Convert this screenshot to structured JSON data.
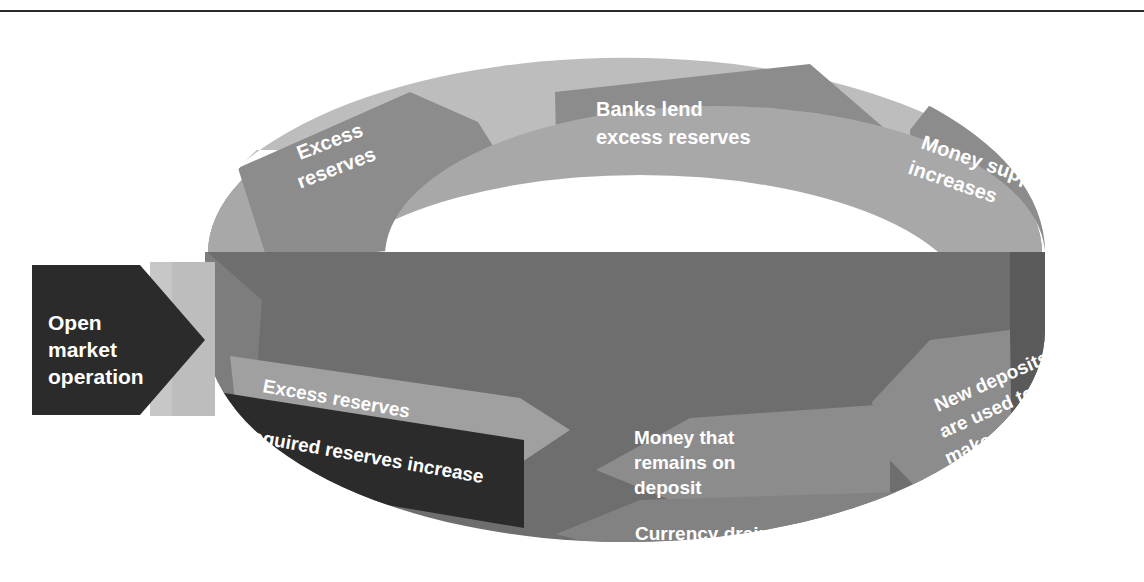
{
  "diagram": {
    "type": "circular-flow-ring",
    "entry_box": {
      "label_line1": "Open",
      "label_line2": "market",
      "label_line3": "operation",
      "shape": "arrow-right-block",
      "color": "#2b2b2b",
      "text_color": "#ffffff"
    },
    "upper_band": {
      "description": "Front-upper half of ring, flow left to right",
      "steps": [
        {
          "id": "excess-reserves-top",
          "label_lines": [
            "Excess",
            "reserves"
          ],
          "arrow_color": "#8c8c8c",
          "band_color": "#bdbdbd",
          "rotation": -22
        },
        {
          "id": "banks-lend",
          "label_lines": [
            "Banks lend",
            "excess reserves"
          ],
          "arrow_color": "#8c8c8c",
          "band_color": "#bdbdbd",
          "rotation": 0
        },
        {
          "id": "money-supply-increases",
          "label_lines": [
            "Money supply",
            "increases"
          ],
          "arrow_color": "#8c8c8c",
          "band_color": "#bdbdbd",
          "rotation": 20
        }
      ]
    },
    "lower_band": {
      "description": "Front-lower half of ring, flow right to left",
      "steps": [
        {
          "id": "new-deposits",
          "label_lines": [
            "New deposits",
            "are used to",
            "make payments"
          ],
          "arrow_color": "#8c8c8c",
          "band_color": "#6e6e6e",
          "rotation": -24
        },
        {
          "id": "money-remains-on-deposit",
          "label_lines": [
            "Money that",
            "remains on",
            "deposit"
          ],
          "arrow_color": "#8c8c8c",
          "band_color": "#6e6e6e",
          "rotation": 0
        },
        {
          "id": "currency-drain",
          "label_lines": [
            "Currency drain"
          ],
          "arrow_color": "#787878",
          "band_color": "#6e6e6e",
          "rotation": 0
        },
        {
          "id": "excess-reserves-bottom",
          "label_lines": [
            "Excess reserves"
          ],
          "arrow_color": "#8c8c8c",
          "band_color": "#6e6e6e",
          "rotation": 17
        },
        {
          "id": "required-reserves-increase",
          "label_lines": [
            "Required reserves increase"
          ],
          "arrow_color": "#2b2b2b",
          "band_color": "#6e6e6e",
          "rotation": 20
        }
      ]
    },
    "colors": {
      "page_background": "#ffffff",
      "rule": "#2b2b2b",
      "band_light": "#bdbdbd",
      "band_mid": "#a6a6a6",
      "band_dark": "#6e6e6e",
      "band_darkest": "#5a5a5a",
      "arrow_gray": "#8c8c8c",
      "arrow_black": "#2b2b2b",
      "ring_interior": "#ffffff",
      "text": "#ffffff"
    }
  }
}
